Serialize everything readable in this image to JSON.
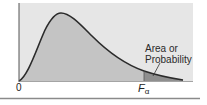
{
  "diagram": {
    "curve": "F-distribution density",
    "labels": {
      "annotation_line1": "Area or",
      "annotation_line2": "Probability",
      "origin": "0",
      "critical_value_main": "F",
      "critical_value_sub": "α"
    },
    "colors": {
      "panel_background": "#e6e6e6",
      "body_fill": "#c4c4c4",
      "tail_fill": "#8f8f8f",
      "curve": "#2b2b2b",
      "axis": "#555555",
      "bottom_rule": "#8a8a8a"
    }
  }
}
